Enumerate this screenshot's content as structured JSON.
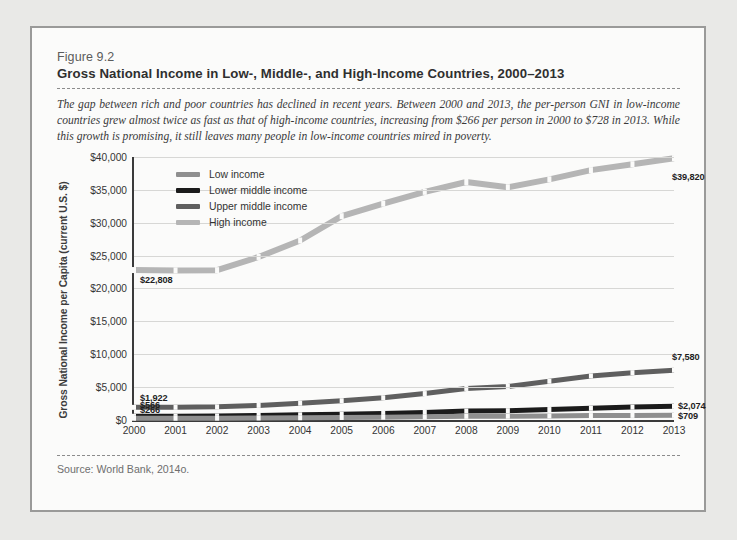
{
  "figure": {
    "number": "Figure 9.2",
    "title": "Gross National Income in Low-, Middle-, and High-Income Countries, 2000–2013",
    "caption": "The gap between rich and poor countries has declined in recent years. Between 2000 and 2013, the per-person GNI in low-income countries grew almost twice as fast as that of high-income countries, increasing from $266 per person in 2000 to $728 in 2013. While this growth is promising, it still leaves many people in low-income countries mired in poverty.",
    "source": "Source: World Bank, 2014o."
  },
  "chart_data": {
    "type": "line",
    "title": "Gross National Income in Low-, Middle-, and High-Income Countries, 2000–2013",
    "xlabel": "",
    "ylabel": "Gross National Income per Capita (current U.S. $)",
    "categories": [
      "2000",
      "2001",
      "2002",
      "2003",
      "2004",
      "2005",
      "2006",
      "2007",
      "2008",
      "2009",
      "2010",
      "2011",
      "2012",
      "2013"
    ],
    "ylim": [
      0,
      40000
    ],
    "yticks": [
      0,
      5000,
      10000,
      15000,
      20000,
      25000,
      30000,
      35000,
      40000
    ],
    "ytick_labels": [
      "$0",
      "$5,000",
      "$10,000",
      "$15,000",
      "$20,000",
      "$25,000",
      "$30,000",
      "$35,000",
      "$40,000"
    ],
    "grid": true,
    "legend_position": "top-left",
    "series": [
      {
        "name": "Low income",
        "color": "#8f8f8f",
        "values": [
          266,
          272,
          285,
          310,
          345,
          385,
          430,
          490,
          565,
          580,
          620,
          670,
          700,
          709
        ],
        "start_label": "$266",
        "end_label": "$709"
      },
      {
        "name": "Lower middle income",
        "color": "#1b1b1b",
        "values": [
          566,
          580,
          610,
          690,
          790,
          880,
          990,
          1150,
          1360,
          1420,
          1590,
          1790,
          1960,
          2074
        ],
        "start_label": "$566",
        "end_label": "$2,074"
      },
      {
        "name": "Upper middle income",
        "color": "#5f5f5f",
        "values": [
          1922,
          1930,
          2000,
          2220,
          2560,
          2930,
          3380,
          4020,
          4800,
          5100,
          5900,
          6700,
          7200,
          7580
        ],
        "start_label": "$1,922",
        "end_label": "$7,580"
      },
      {
        "name": "High income",
        "color": "#b5b5b5",
        "values": [
          22808,
          22750,
          22790,
          24800,
          27300,
          31000,
          32900,
          34700,
          36200,
          35400,
          36600,
          38000,
          38900,
          39820
        ],
        "start_label": "$22,808",
        "end_label": "$39,820"
      }
    ],
    "data_labels": [
      {
        "text": "$39,820",
        "series": "High income",
        "position": "end-right"
      },
      {
        "text": "$22,808",
        "series": "High income",
        "position": "start-right"
      },
      {
        "text": "$7,580",
        "series": "Upper middle income",
        "position": "end-right"
      },
      {
        "text": "$2,074",
        "series": "Lower middle income",
        "position": "end-right"
      },
      {
        "text": "$709",
        "series": "Low income",
        "position": "end-right"
      },
      {
        "text": "$1,922",
        "series": "Upper middle income",
        "position": "start-right"
      },
      {
        "text": "$566",
        "series": "Lower middle income",
        "position": "start-right"
      },
      {
        "text": "$266",
        "series": "Low income",
        "position": "start-right"
      }
    ]
  }
}
